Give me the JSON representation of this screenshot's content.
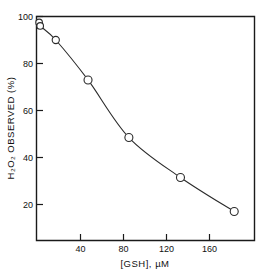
{
  "chart_data": {
    "type": "scatter",
    "title": "",
    "xlabel": "[GSH], µM",
    "ylabel": "H₂O₂ OBSERVED (%)",
    "xlim": [
      0,
      200
    ],
    "ylim": [
      5,
      100
    ],
    "grid": false,
    "legend": null,
    "x_ticks": [
      40,
      80,
      120,
      160
    ],
    "x_tick_labels": [
      "40",
      "80",
      "120",
      "160"
    ],
    "y_ticks": [
      20,
      40,
      60,
      80,
      100
    ],
    "y_tick_labels": [
      "20",
      "40",
      "60",
      "80",
      "100"
    ],
    "marker": "open-circle",
    "line": "smooth-fitted-curve",
    "series": [
      {
        "name": "H2O2 observed vs GSH",
        "points": [
          {
            "x": 1.5,
            "y": 97.5
          },
          {
            "x": 2.5,
            "y": 96.0
          },
          {
            "x": 17.0,
            "y": 90.0
          },
          {
            "x": 47.0,
            "y": 73.0
          },
          {
            "x": 85.0,
            "y": 48.5
          },
          {
            "x": 133.0,
            "y": 31.5
          },
          {
            "x": 183.0,
            "y": 17.0
          }
        ]
      }
    ]
  },
  "axes": {
    "x_title": "[GSH], µM",
    "y_title": "H₂O₂ OBSERVED (%)",
    "x_tick_1": "40",
    "x_tick_2": "80",
    "x_tick_3": "120",
    "x_tick_4": "160",
    "y_tick_1": "20",
    "y_tick_2": "40",
    "y_tick_3": "60",
    "y_tick_4": "80",
    "y_tick_5": "100"
  },
  "colors": {
    "axis": "#1a1a1a",
    "curve": "#2b2b2b",
    "marker_fill": "#ffffff",
    "background": "#ffffff"
  }
}
